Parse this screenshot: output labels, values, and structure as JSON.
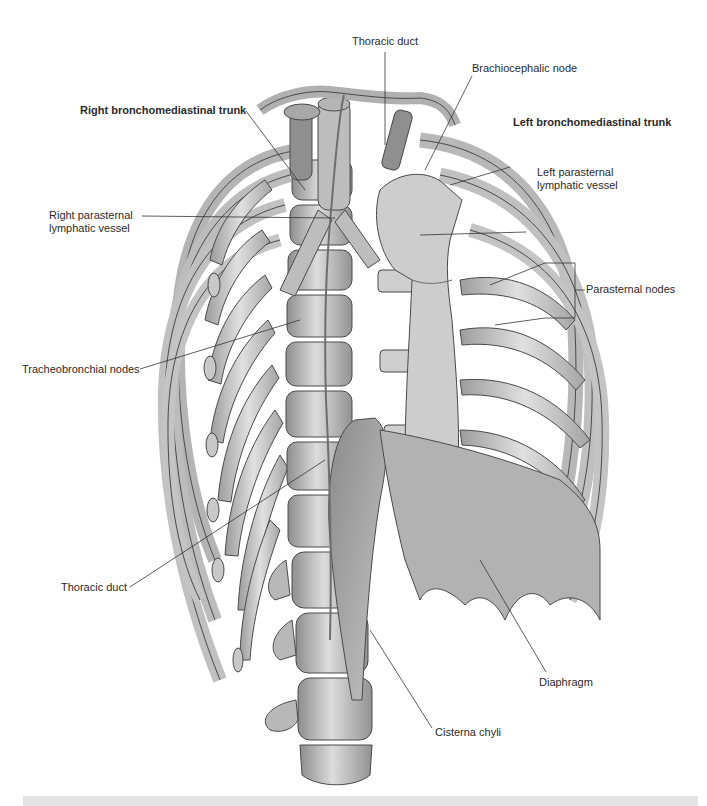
{
  "figure": {
    "colors": {
      "bone": "#d4d4d4",
      "bone_shade": "#9a9a9a",
      "outline": "#4a4a4a",
      "muscle": "#a8a8a8",
      "leader": "#333333",
      "footer_bar": "#e3e3e3"
    }
  },
  "labels": {
    "thoracic_duct_top": "Thoracic duct",
    "brachiocephalic_node": "Brachiocephalic node",
    "right_bronchomediastinal_trunk": "Right bronchomediastinal trunk",
    "left_bronchomediastinal_trunk": "Left bronchomediastinal trunk",
    "left_parasternal_line1": "Left parasternal",
    "left_parasternal_line2": "lymphatic vessel",
    "right_parasternal_line1": "Right parasternal",
    "right_parasternal_line2": "lymphatic vessel",
    "parasternal_nodes": "Parasternal nodes",
    "tracheobronchial_nodes": "Tracheobronchial nodes",
    "thoracic_duct_bottom": "Thoracic duct",
    "diaphragm": "Diaphragm",
    "cisterna_chyli": "Cisterna chyli"
  }
}
